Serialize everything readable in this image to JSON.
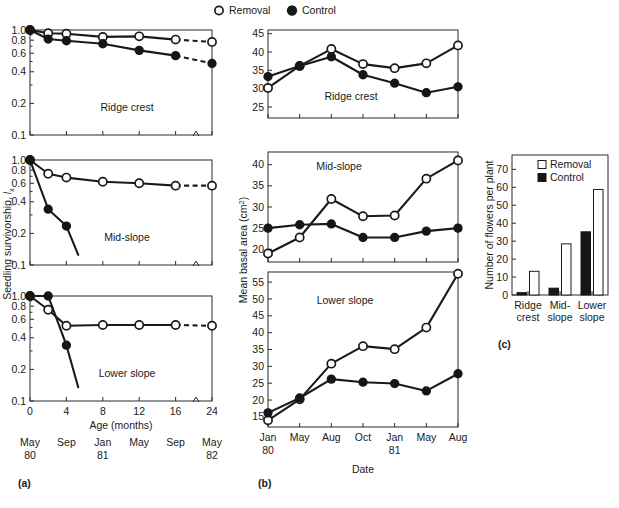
{
  "figure": {
    "legend": [
      {
        "label": "Removal",
        "marker": "open-circle-icon"
      },
      {
        "label": "Control",
        "marker": "filled-circle-icon"
      }
    ]
  },
  "panel_a": {
    "letter": "(a)",
    "ylabel_main": "Seedling survivorship, ",
    "ylabel_italic": "l",
    "ylabel_sub": "x",
    "xlabel": "Age (months)",
    "xticks": [
      "0",
      "4",
      "8",
      "12",
      "16",
      "24"
    ],
    "date_row1": [
      "May",
      "Sep",
      "Jan",
      "May",
      "Sep",
      "May"
    ],
    "date_row2": [
      "80",
      "",
      "81",
      "",
      "",
      "82"
    ],
    "yticks": [
      "1.0",
      "0.8",
      "0.6",
      "0.4",
      "0.2",
      "0.1"
    ],
    "subpanels": [
      "Ridge crest",
      "Mid-slope",
      "Lower slope"
    ]
  },
  "panel_b": {
    "letter": "(b)",
    "ylabel_main": "Mean basal area (cm",
    "ylabel_sup": "2",
    "ylabel_tail": ")",
    "xlabel": "Date",
    "xticks": [
      "Jan",
      "May",
      "Aug",
      "Oct",
      "Jan",
      "May",
      "Aug"
    ],
    "xtick_years": [
      "80",
      "",
      "",
      "",
      "81",
      "",
      ""
    ],
    "subpanels": [
      "Ridge crest",
      "Mid-slope",
      "Lower slope"
    ]
  },
  "panel_c": {
    "letter": "(c)",
    "ylabel": "Number of flowers per plant",
    "legend": [
      {
        "label": "Removal",
        "swatch": "open-square-icon"
      },
      {
        "label": "Control",
        "swatch": "filled-square-icon"
      }
    ],
    "xtick_row1": [
      "Ridge",
      "Mid-",
      "Lower"
    ],
    "xtick_row2": [
      "crest",
      "slope",
      "slope"
    ],
    "yticks": [
      "0",
      "10",
      "20",
      "30",
      "40",
      "50",
      "60",
      "70"
    ]
  },
  "colors": {
    "ink": "#1a1a1a",
    "marker_fill_open": "#ffffff",
    "marker_fill_closed": "#161616",
    "frame": "#2a2a2a"
  },
  "chart_data": [
    {
      "type": "line",
      "id": "a-ridge-crest",
      "title": "Ridge crest",
      "xlabel": "Age (months)",
      "ylabel": "Seedling survivorship, lx",
      "x": [
        0,
        2,
        4,
        8,
        12,
        16,
        24
      ],
      "xlim": [
        0,
        24
      ],
      "ytype": "log",
      "yticks": [
        1.0,
        0.8,
        0.6,
        0.4,
        0.2,
        0.1
      ],
      "ylim": [
        0.1,
        1.0
      ],
      "grid": false,
      "axis_break_x": 21,
      "series": [
        {
          "name": "Removal",
          "marker": "open-circle",
          "values": [
            1.0,
            0.93,
            0.92,
            0.86,
            0.87,
            0.81,
            0.77
          ],
          "dash_last_segment": true
        },
        {
          "name": "Control",
          "marker": "filled-circle",
          "values": [
            1.0,
            0.82,
            0.79,
            0.74,
            0.64,
            0.57,
            0.48
          ],
          "dash_last_segment": true
        }
      ]
    },
    {
      "type": "line",
      "id": "a-mid-slope",
      "title": "Mid-slope",
      "xlabel": "Age (months)",
      "ylabel": "Seedling survivorship, lx",
      "x": [
        0,
        2,
        4,
        8,
        12,
        16,
        24
      ],
      "xlim": [
        0,
        24
      ],
      "ytype": "log",
      "yticks": [
        1.0,
        0.8,
        0.6,
        0.4,
        0.2,
        0.1
      ],
      "ylim": [
        0.1,
        1.0
      ],
      "grid": false,
      "axis_break_x": 21,
      "series": [
        {
          "name": "Removal",
          "marker": "open-circle",
          "values": [
            1.0,
            0.74,
            0.68,
            0.62,
            0.6,
            0.57,
            0.57
          ],
          "dash_last_segment": true
        },
        {
          "name": "Control",
          "marker": "filled-circle",
          "values": [
            1.0,
            0.34,
            0.235,
            null,
            null,
            null,
            null
          ],
          "extends_below": 0.125
        }
      ]
    },
    {
      "type": "line",
      "id": "a-lower-slope",
      "title": "Lower slope",
      "xlabel": "Age (months)",
      "ylabel": "Seedling survivorship, lx",
      "x": [
        0,
        2,
        4,
        8,
        12,
        16,
        24
      ],
      "xlim": [
        0,
        24
      ],
      "ytype": "log",
      "yticks": [
        1.0,
        0.8,
        0.6,
        0.4,
        0.2,
        0.1
      ],
      "ylim": [
        0.1,
        1.0
      ],
      "grid": false,
      "axis_break_x": 21,
      "series": [
        {
          "name": "Removal",
          "marker": "open-circle",
          "values": [
            1.0,
            0.74,
            0.52,
            0.53,
            0.53,
            0.53,
            0.52
          ],
          "dash_last_segment": true
        },
        {
          "name": "Control",
          "marker": "filled-circle",
          "values": [
            1.0,
            1.0,
            0.34,
            null,
            null,
            null,
            null
          ],
          "extends_below": 0.135
        }
      ]
    },
    {
      "type": "line",
      "id": "b-ridge-crest",
      "title": "Ridge crest",
      "xlabel": "Date",
      "ylabel": "Mean basal area (cm2)",
      "categories": [
        "Jan 80",
        "May",
        "Aug",
        "Oct",
        "Jan 81",
        "May",
        "Aug"
      ],
      "yticks": [
        25,
        30,
        35,
        40,
        45
      ],
      "ylim": [
        22,
        46
      ],
      "grid": false,
      "series": [
        {
          "name": "Removal",
          "marker": "open-circle",
          "values": [
            30.2,
            36.2,
            40.8,
            36.7,
            35.6,
            36.9,
            41.8
          ]
        },
        {
          "name": "Control",
          "marker": "filled-circle",
          "values": [
            33.3,
            36.2,
            38.7,
            33.8,
            31.5,
            28.9,
            30.5
          ]
        }
      ]
    },
    {
      "type": "line",
      "id": "b-mid-slope",
      "title": "Mid-slope",
      "xlabel": "Date",
      "ylabel": "Mean basal area (cm2)",
      "categories": [
        "Jan 80",
        "May",
        "Aug",
        "Oct",
        "Jan 81",
        "May",
        "Aug"
      ],
      "yticks": [
        20,
        25,
        30,
        35,
        40
      ],
      "ylim": [
        17,
        43
      ],
      "grid": false,
      "series": [
        {
          "name": "Removal",
          "marker": "open-circle",
          "values": [
            19.0,
            22.8,
            31.9,
            27.8,
            28.0,
            36.7,
            41.0
          ]
        },
        {
          "name": "Control",
          "marker": "filled-circle",
          "values": [
            25.0,
            25.8,
            26.0,
            22.8,
            22.8,
            24.3,
            25.0
          ]
        }
      ]
    },
    {
      "type": "line",
      "id": "b-lower-slope",
      "title": "Lower slope",
      "xlabel": "Date",
      "ylabel": "Mean basal area (cm2)",
      "categories": [
        "Jan 80",
        "May",
        "Aug",
        "Oct",
        "Jan 81",
        "May",
        "Aug"
      ],
      "yticks": [
        15,
        20,
        25,
        30,
        35,
        40,
        45,
        50,
        55
      ],
      "ylim": [
        12,
        58
      ],
      "grid": false,
      "series": [
        {
          "name": "Removal",
          "marker": "open-circle",
          "values": [
            14.0,
            20.2,
            30.8,
            36.0,
            35.1,
            41.5,
            57.5
          ]
        },
        {
          "name": "Control",
          "marker": "filled-circle",
          "values": [
            16.2,
            20.6,
            26.2,
            25.3,
            24.9,
            22.7,
            27.8
          ]
        }
      ]
    },
    {
      "type": "bar",
      "id": "c-flowers",
      "title": "",
      "xlabel": "",
      "ylabel": "Number of flowers per plant",
      "categories": [
        "Ridge crest",
        "Mid-slope",
        "Lower slope"
      ],
      "yticks": [
        0,
        10,
        20,
        30,
        40,
        50,
        60,
        70
      ],
      "ylim": [
        0,
        78
      ],
      "grid": false,
      "series": [
        {
          "name": "Control",
          "style": "filled",
          "values": [
            1.3,
            3.8,
            35.2
          ]
        },
        {
          "name": "Removal",
          "style": "open",
          "values": [
            13.2,
            28.5,
            58.8
          ]
        }
      ]
    }
  ]
}
